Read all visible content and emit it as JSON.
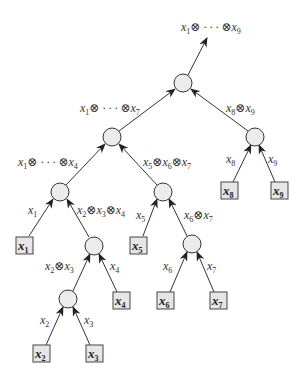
{
  "diagram": {
    "colors": {
      "node_fill": "#ececec",
      "stroke": "#333333",
      "box_fill": "#e6e6e6"
    },
    "output_label": {
      "text": "x",
      "sub1": "1",
      "mid": "⊗ · · · ⊗x",
      "sub2": "9"
    },
    "edge_labels": {
      "root_left": {
        "text": "x",
        "sub1": "1",
        "mid": "⊗ · · · ⊗x",
        "sub2": "7"
      },
      "root_right": {
        "text": "x",
        "sub1": "8",
        "mid": "⊗x",
        "sub2": "9"
      },
      "n7_left": {
        "text": "x",
        "sub1": "1",
        "mid": "⊗ · · · ⊗x",
        "sub2": "4"
      },
      "n7_right": {
        "text": "x",
        "sub1": "5",
        "mid": "⊗x",
        "sub2": "6",
        "mid2": "⊗x",
        "sub3": "7"
      },
      "n4_left": {
        "text": "x",
        "sub1": "1"
      },
      "n4_right": {
        "text": "x",
        "sub1": "2",
        "mid": "⊗x",
        "sub2": "3",
        "mid2": "⊗x",
        "sub3": "4"
      },
      "n567_left": {
        "text": "x",
        "sub1": "5"
      },
      "n567_right": {
        "text": "x",
        "sub1": "6",
        "mid": "⊗x",
        "sub2": "7"
      },
      "n234_left": {
        "text": "x",
        "sub1": "2",
        "mid": "⊗x",
        "sub2": "3"
      },
      "n234_right": {
        "text": "x",
        "sub1": "4"
      },
      "n67_left": {
        "text": "x",
        "sub1": "6"
      },
      "n67_right": {
        "text": "x",
        "sub1": "7"
      },
      "n23_left": {
        "text": "x",
        "sub1": "2"
      },
      "n23_right": {
        "text": "x",
        "sub1": "3"
      },
      "n89_left": {
        "text": "x",
        "sub1": "8"
      },
      "n89_right": {
        "text": "x",
        "sub1": "9"
      }
    },
    "leaves": [
      {
        "text": "x",
        "sub": "1"
      },
      {
        "text": "x",
        "sub": "2"
      },
      {
        "text": "x",
        "sub": "3"
      },
      {
        "text": "x",
        "sub": "4"
      },
      {
        "text": "x",
        "sub": "5"
      },
      {
        "text": "x",
        "sub": "6"
      },
      {
        "text": "x",
        "sub": "7"
      },
      {
        "text": "x",
        "sub": "8"
      },
      {
        "text": "x",
        "sub": "9"
      }
    ]
  }
}
